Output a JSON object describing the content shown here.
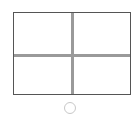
{
  "grid": {
    "rows": 2,
    "columns": 2,
    "frame_color": "#555555",
    "divider_color": "#9a9a9a",
    "cells": [
      {
        "row": 0,
        "col": 0,
        "label": ""
      },
      {
        "row": 0,
        "col": 1,
        "label": ""
      },
      {
        "row": 1,
        "col": 0,
        "label": ""
      },
      {
        "row": 1,
        "col": 1,
        "label": ""
      }
    ]
  },
  "indicator": {
    "shape": "circle",
    "state": "unselected",
    "color": "#c8c8c8"
  }
}
